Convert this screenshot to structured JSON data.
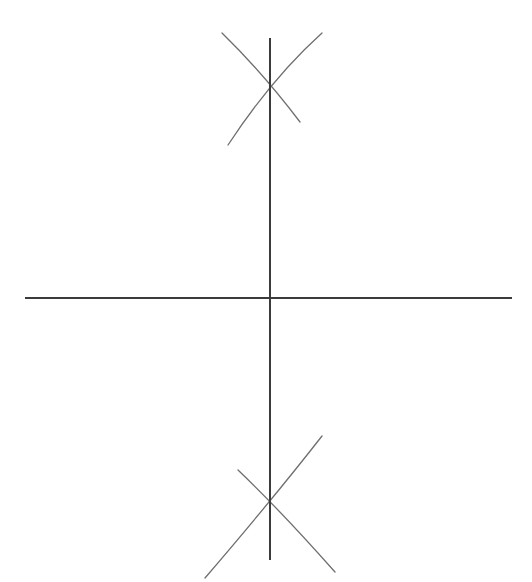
{
  "figure": {
    "canvas": {
      "width": 532,
      "height": 582,
      "background_color": "#ffffff"
    },
    "colors": {
      "axis": "#3b3b3b",
      "arc": "#6f6f6f",
      "background": "#ffffff"
    },
    "stroke_widths": {
      "axis": 2.0,
      "arc": 1.3
    },
    "points": {
      "origin": {
        "label": "origin",
        "x": 270,
        "y": 298
      },
      "upper_intersection": {
        "label": "upper arc intersection",
        "x": 270,
        "y": 75
      },
      "lower_intersection": {
        "label": "lower arc intersection",
        "x": 270,
        "y": 515
      }
    },
    "axes": [
      {
        "name": "horizontal-axis",
        "orientation": "horizontal",
        "x1": 25,
        "y1": 298,
        "x2": 512,
        "y2": 298
      },
      {
        "name": "vertical-axis",
        "orientation": "vertical",
        "x1": 270,
        "y1": 38,
        "x2": 270,
        "y2": 560
      }
    ],
    "arcs": [
      {
        "name": "upper-arc-left-center",
        "group": "upper",
        "path": "M 222 33 Q 262 72 300 122",
        "start": [
          222,
          33
        ],
        "end": [
          300,
          122
        ]
      },
      {
        "name": "upper-arc-right-center",
        "group": "upper",
        "path": "M 322 33 Q 272 78 228 145",
        "start": [
          322,
          33
        ],
        "end": [
          228,
          145
        ]
      },
      {
        "name": "lower-arc-left-center",
        "group": "lower",
        "path": "M 238 470 Q 280 510 335 572",
        "start": [
          238,
          470
        ],
        "end": [
          335,
          572
        ]
      },
      {
        "name": "lower-arc-right-center",
        "group": "lower",
        "path": "M 322 436 Q 272 500 205 578",
        "start": [
          322,
          436
        ],
        "end": [
          205,
          578
        ]
      }
    ]
  }
}
